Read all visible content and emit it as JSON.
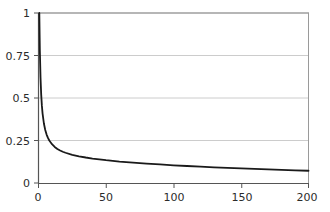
{
  "chart_data": {
    "type": "line",
    "title": "",
    "subtitle": "",
    "xlabel": "",
    "ylabel": "",
    "xlim": [
      0,
      200
    ],
    "ylim": [
      0,
      1
    ],
    "xticks": [
      0,
      50,
      100,
      150,
      200
    ],
    "xtick_labels": [
      "0",
      "50",
      "100",
      "150",
      "200"
    ],
    "yticks": [
      0,
      0.25,
      0.5,
      0.75,
      1
    ],
    "ytick_labels": [
      "0",
      "0.25",
      "0.5",
      "0.75",
      "1"
    ],
    "grid": "horizontal",
    "grid_color": "#c9c9c9",
    "axis_color": "#555555",
    "line_color": "#1a1a1a",
    "line_width": 1.8,
    "legend": null,
    "annotations": [],
    "series": [
      {
        "name": "decay",
        "x": [
          0.6,
          1,
          1.5,
          2,
          2.5,
          3,
          4,
          5,
          6,
          7,
          8,
          10,
          12,
          14,
          16,
          18,
          20,
          25,
          30,
          35,
          40,
          45,
          50,
          60,
          70,
          80,
          90,
          100,
          110,
          120,
          130,
          140,
          150,
          160,
          170,
          180,
          190,
          200
        ],
        "y": [
          1.0,
          0.78,
          0.62,
          0.52,
          0.455,
          0.41,
          0.35,
          0.312,
          0.285,
          0.265,
          0.25,
          0.228,
          0.212,
          0.2,
          0.191,
          0.184,
          0.178,
          0.166,
          0.157,
          0.15,
          0.144,
          0.139,
          0.134,
          0.126,
          0.12,
          0.114,
          0.109,
          0.104,
          0.1,
          0.096,
          0.092,
          0.089,
          0.086,
          0.083,
          0.08,
          0.077,
          0.074,
          0.072
        ]
      }
    ]
  },
  "axes": {
    "y_labels": [
      "1",
      "0.75",
      "0.5",
      "0.25",
      "0"
    ],
    "x_labels": [
      "0",
      "50",
      "100",
      "150",
      "200"
    ]
  }
}
